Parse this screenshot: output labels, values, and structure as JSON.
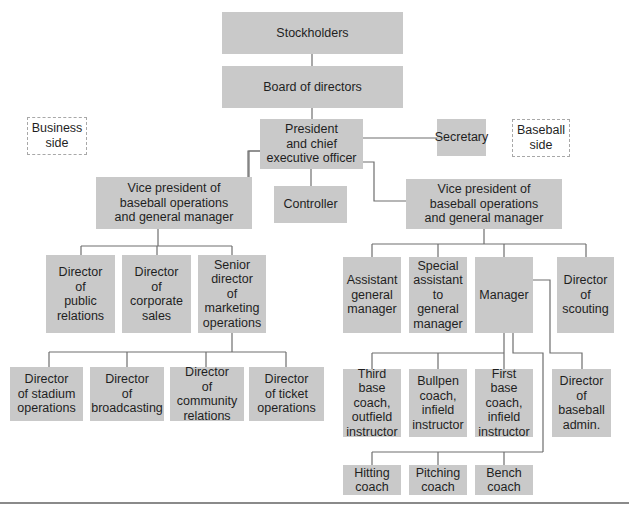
{
  "chart": {
    "labels": {
      "stockholders": "Stockholders",
      "board": "Board of directors",
      "president": "President\nand chief\nexecutive officer",
      "secretary": "Secretary",
      "business_side": "Business\nside",
      "baseball_side": "Baseball\nside",
      "vp_left": "Vice president of\nbaseball operations\nand general manager",
      "controller": "Controller",
      "vp_right": "Vice president of\nbaseball operations\nand general manager",
      "dir_public_relations": "Director\nof\npublic\nrelations",
      "dir_corporate_sales": "Director\nof\ncorporate\nsales",
      "senior_dir_marketing": "Senior\ndirector\nof marketing\noperations",
      "dir_stadium_operations": "Director\nof stadium\noperations",
      "dir_broadcasting": "Director\nof\nbroadcasting",
      "dir_community_relations": "Director\nof community\nrelations",
      "dir_ticket_operations": "Director\nof ticket\noperations",
      "assistant_gm": "Assistant\ngeneral\nmanager",
      "special_assistant_gm": "Special\nassistant\nto general\nmanager",
      "manager": "Manager",
      "dir_scouting": "Director\nof\nscouting",
      "third_base_coach": "Third base\ncoach,\noutfield\ninstructor",
      "bullpen_coach": "Bullpen\ncoach,\ninfield\ninstructor",
      "first_base_coach": "First base\ncoach,\ninfield\ninstructor",
      "dir_baseball_admin": "Director\nof\nbaseball\nadmin.",
      "hitting_coach": "Hitting\ncoach",
      "pitching_coach": "Pitching\ncoach",
      "bench_coach": "Bench\ncoach"
    },
    "colors": {
      "box_fill": "#c9c9c9",
      "line": "#6e6e6e",
      "dashed_border": "#a8a8a8"
    }
  }
}
